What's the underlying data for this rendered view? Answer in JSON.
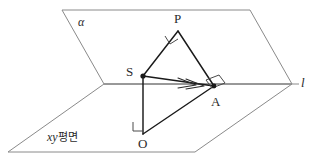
{
  "figure": {
    "kind": "3d-geometry-diagram",
    "background_color": "#ffffff",
    "stroke_color_planes": "#8a8a8a",
    "stroke_color_solids": "#1a1a1a",
    "labels": {
      "alpha": "α",
      "point_p": "P",
      "point_s": "S",
      "point_a": "A",
      "point_o": "O",
      "line_l": "l",
      "plane_xy_italic": "xy",
      "plane_xy_korean": "평면"
    },
    "points": {
      "P": {
        "x": 178,
        "y": 31
      },
      "S": {
        "x": 143,
        "y": 76
      },
      "A": {
        "x": 214,
        "y": 86
      },
      "O": {
        "x": 143,
        "y": 134
      }
    },
    "planes": {
      "alpha": {
        "name": "α",
        "vertices": [
          {
            "x": 62,
            "y": 10
          },
          {
            "x": 250,
            "y": 10
          },
          {
            "x": 292,
            "y": 84
          },
          {
            "x": 104,
            "y": 84
          }
        ]
      },
      "xy": {
        "name": "xy평면",
        "vertices": [
          {
            "x": 104,
            "y": 84
          },
          {
            "x": 292,
            "y": 84
          },
          {
            "x": 195,
            "y": 152
          },
          {
            "x": 8,
            "y": 152
          }
        ]
      }
    },
    "line_l": {
      "x1": 104,
      "y1": 84,
      "x2": 299,
      "y2": 84
    },
    "segments": [
      {
        "name": "SP",
        "from": "S",
        "to": "P"
      },
      {
        "name": "PA",
        "from": "P",
        "to": "A"
      },
      {
        "name": "SA",
        "from": "S",
        "to": "A"
      },
      {
        "name": "SO",
        "from": "S",
        "to": "O"
      },
      {
        "name": "OA",
        "from": "O",
        "to": "A"
      }
    ],
    "right_angle_marks": [
      {
        "at": "P",
        "note": "angle SPA right angle marker"
      },
      {
        "at": "A",
        "note": "angle between l and PA/SA right angle marker"
      },
      {
        "at": "O",
        "note": "angle SOA right angle marker"
      }
    ],
    "tick_marks": [
      {
        "on": "SA",
        "note": "double chevron arrow ticks pointing toward A"
      }
    ]
  }
}
